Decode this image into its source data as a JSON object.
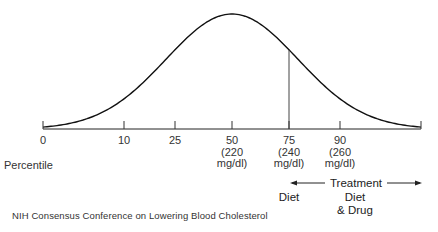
{
  "chart_data": {
    "type": "line",
    "title": "",
    "xlabel": "Percentile",
    "ylabel": "",
    "curve": "normal",
    "ticks": [
      {
        "percentile": 0,
        "label": [
          "0"
        ]
      },
      {
        "percentile": 10,
        "label": [
          "10"
        ]
      },
      {
        "percentile": 25,
        "label": [
          "25"
        ]
      },
      {
        "percentile": 50,
        "label": [
          "50",
          "(220",
          "mg/dl)"
        ]
      },
      {
        "percentile": 75,
        "label": [
          "75",
          "(240",
          "mg/dl)"
        ]
      },
      {
        "percentile": 90,
        "label": [
          "90",
          "(260",
          "mg/dl)"
        ]
      },
      {
        "percentile": 100,
        "label": [
          ""
        ]
      }
    ],
    "cutoff_line": {
      "percentile": 75
    },
    "annotations": {
      "treatment": "Treatment",
      "diet": "Diet",
      "diet_drug_line1": "Diet",
      "diet_drug_line2": "& Drug"
    },
    "grid": false
  },
  "source": "NIH Consensus Conference on Lowering Blood Cholesterol"
}
